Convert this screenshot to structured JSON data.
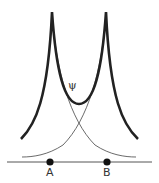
{
  "diagram": {
    "labels": {
      "psi": "ψ",
      "atom_a": "A",
      "atom_b": "B"
    },
    "colors": {
      "curve": "#222222",
      "thin_curve": "#444444",
      "axis": "#555555",
      "nucleus": "#111111"
    },
    "elements": {
      "combined_wavefunction": "thick curve with cusps at A and B",
      "orbital_a": "thin decaying curve centered on A",
      "orbital_b": "thin decaying curve centered on B",
      "axis": "horizontal internuclear axis",
      "nuclei": [
        "A",
        "B"
      ]
    }
  }
}
